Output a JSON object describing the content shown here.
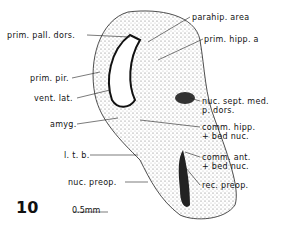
{
  "figure": {
    "number": "10",
    "scale_bar": "0.5mm",
    "labels": {
      "prim_pall_dors": "prim. pall. dors.",
      "parahip_area": "parahip. area",
      "prim_hipp_a": "prim. hipp. a",
      "prim_pir": "prim. pir.",
      "vent_lat": "vent. lat.",
      "nuc_sept_med_1": "nuc. sept. med.",
      "nuc_sept_med_2": "p. dors.",
      "amyg": "amyg.",
      "comm_hipp_1": "comm. hipp.",
      "comm_hipp_2": "+ bed nuc.",
      "ltb": "l. t. b.",
      "comm_ant_1": "comm. ant.",
      "comm_ant_2": "+ bed nuc.",
      "nuc_preop": "nuc. preop.",
      "rec_preop": "rec. preop."
    }
  }
}
